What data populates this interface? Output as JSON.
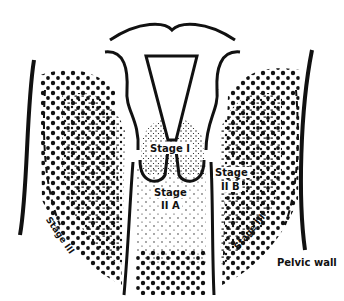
{
  "diagram": {
    "colors": {
      "ink": "#111111",
      "background": "#ffffff"
    },
    "labels": {
      "stage_1": "Stage I",
      "stage_2a_line1": "Stage",
      "stage_2a_line2": "II A",
      "stage_2b_line1": "Stage",
      "stage_2b_line2": "II B",
      "stage_3_left": "Stage III",
      "stage_3_right": "Stage III",
      "pelvic_wall": "Pelvic wall"
    },
    "regions": [
      {
        "name": "stage-1",
        "pattern": "fine-stipple",
        "location": "cervix"
      },
      {
        "name": "stage-2a",
        "pattern": "sparse-stipple",
        "location": "upper vagina"
      },
      {
        "name": "stage-2b",
        "pattern": "medium-dots",
        "location": "parametrium"
      },
      {
        "name": "stage-3",
        "pattern": "large-dots",
        "location": "pelvic sidewall / lower vagina"
      }
    ]
  }
}
